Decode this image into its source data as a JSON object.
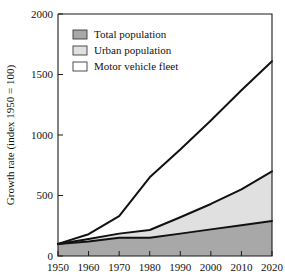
{
  "chart_data": {
    "type": "area",
    "title": "",
    "xlabel": "",
    "ylabel": "Growth rate (index 1950 = 100)",
    "xlim": [
      1950,
      2020
    ],
    "ylim": [
      0,
      2000
    ],
    "x_ticks": [
      1950,
      1960,
      1970,
      1980,
      1990,
      2000,
      2010,
      2020
    ],
    "y_ticks": [
      0,
      500,
      1000,
      1500,
      2000
    ],
    "grid": false,
    "stacked": false,
    "legend_position": "top-left",
    "x": [
      1950,
      1960,
      1970,
      1980,
      1990,
      2000,
      2010,
      2020
    ],
    "series": [
      {
        "name": "Motor vehicle fleet",
        "fill": "#ffffff",
        "values": [
          100,
          180,
          330,
          650,
          880,
          1120,
          1370,
          1610
        ]
      },
      {
        "name": "Urban population",
        "fill": "#e0e0e0",
        "values": [
          100,
          140,
          185,
          215,
          320,
          430,
          550,
          700
        ]
      },
      {
        "name": "Total population",
        "fill": "#a8a8a8",
        "values": [
          100,
          120,
          150,
          150,
          185,
          220,
          255,
          290
        ]
      }
    ]
  },
  "legend": {
    "items": [
      {
        "label": "Total population",
        "color": "#a8a8a8"
      },
      {
        "label": "Urban population",
        "color": "#e0e0e0"
      },
      {
        "label": "Motor vehicle fleet",
        "color": "#ffffff"
      }
    ]
  },
  "axes": {
    "y_title": "Growth rate (index 1950 = 100)",
    "y_tick_labels": [
      "0",
      "500",
      "1000",
      "1500",
      "2000"
    ],
    "x_tick_labels": [
      "1950",
      "1960",
      "1970",
      "1980",
      "1990",
      "2000",
      "2010",
      "2020"
    ]
  },
  "colors": {
    "axis": "#1a1a1a",
    "line": "#111111",
    "total_population": "#a8a8a8",
    "urban_population": "#e0e0e0",
    "motor_vehicle_fleet": "#ffffff",
    "background": "#ffffff"
  }
}
